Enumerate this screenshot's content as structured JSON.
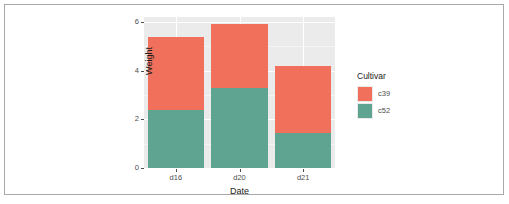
{
  "chart_data": {
    "type": "bar",
    "subtype": "stacked",
    "title": "",
    "xlabel": "Date",
    "ylabel": "Weight",
    "categories": [
      "d16",
      "d20",
      "d21"
    ],
    "series": [
      {
        "name": "c52",
        "color": "#5fa391",
        "values": [
          2.4,
          3.3,
          1.45
        ]
      },
      {
        "name": "c39",
        "color": "#f1705b",
        "values": [
          3.0,
          2.6,
          2.75
        ]
      }
    ],
    "stack_order_bottom_to_top": [
      "c52",
      "c39"
    ],
    "totals": [
      5.4,
      5.9,
      4.2
    ],
    "ylim": [
      0,
      6.2
    ],
    "y_ticks": [
      0,
      2,
      4,
      6
    ],
    "y_tick_labels": [
      "0",
      "2",
      "4",
      "6"
    ],
    "y_minor_ticks": [
      1,
      3,
      5
    ],
    "x_tick_labels": [
      "d16",
      "d20",
      "d21"
    ],
    "grid": true,
    "grid_color": "#ffffff",
    "panel_background": "#ebebeb",
    "legend_position": "right",
    "legend": {
      "title": "Cultivar",
      "entries": [
        {
          "label": "c39",
          "color": "#f1705b"
        },
        {
          "label": "c52",
          "color": "#5fa391"
        }
      ]
    }
  }
}
